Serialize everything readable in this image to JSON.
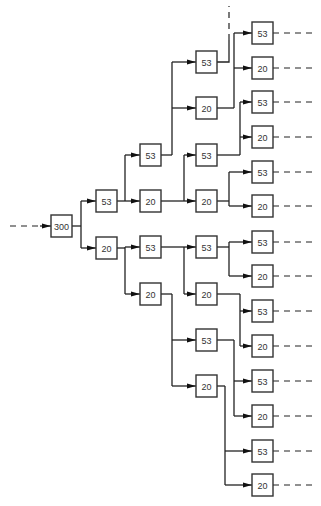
{
  "diagram": {
    "type": "tree",
    "root": {
      "label": "300",
      "x": 51,
      "y": 215
    },
    "box_size": [
      21,
      22
    ],
    "nodes": [
      {
        "id": "n0",
        "label": "300",
        "x": 51,
        "y": 215
      },
      {
        "id": "c1a",
        "label": "53",
        "x": 96,
        "y": 190
      },
      {
        "id": "c1b",
        "label": "20",
        "x": 96,
        "y": 237
      },
      {
        "id": "c2a",
        "label": "53",
        "x": 140,
        "y": 144
      },
      {
        "id": "c2b",
        "label": "20",
        "x": 140,
        "y": 190
      },
      {
        "id": "c2c",
        "label": "53",
        "x": 140,
        "y": 236
      },
      {
        "id": "c2d",
        "label": "20",
        "x": 140,
        "y": 283
      },
      {
        "id": "c3a",
        "label": "53",
        "x": 196,
        "y": 51
      },
      {
        "id": "c3b",
        "label": "20",
        "x": 196,
        "y": 97
      },
      {
        "id": "c3c",
        "label": "53",
        "x": 196,
        "y": 144
      },
      {
        "id": "c3d",
        "label": "20",
        "x": 196,
        "y": 190
      },
      {
        "id": "c3e",
        "label": "53",
        "x": 196,
        "y": 236
      },
      {
        "id": "c3f",
        "label": "20",
        "x": 196,
        "y": 283
      },
      {
        "id": "c3g",
        "label": "53",
        "x": 196,
        "y": 329
      },
      {
        "id": "c3h",
        "label": "20",
        "x": 196,
        "y": 375
      },
      {
        "id": "c4a",
        "label": "53",
        "x": 252,
        "y": 22
      },
      {
        "id": "c4b",
        "label": "20",
        "x": 252,
        "y": 57
      },
      {
        "id": "c4c",
        "label": "53",
        "x": 252,
        "y": 91
      },
      {
        "id": "c4d",
        "label": "20",
        "x": 252,
        "y": 126
      },
      {
        "id": "c4e",
        "label": "53",
        "x": 252,
        "y": 161
      },
      {
        "id": "c4f",
        "label": "20",
        "x": 252,
        "y": 195
      },
      {
        "id": "c4g",
        "label": "53",
        "x": 252,
        "y": 231
      },
      {
        "id": "c4h",
        "label": "20",
        "x": 252,
        "y": 265
      },
      {
        "id": "c4i",
        "label": "53",
        "x": 252,
        "y": 300
      },
      {
        "id": "c4j",
        "label": "20",
        "x": 252,
        "y": 335
      },
      {
        "id": "c4k",
        "label": "53",
        "x": 252,
        "y": 370
      },
      {
        "id": "c4l",
        "label": "20",
        "x": 252,
        "y": 405
      },
      {
        "id": "c4m",
        "label": "53",
        "x": 252,
        "y": 440
      },
      {
        "id": "c4n",
        "label": "20",
        "x": 252,
        "y": 474
      }
    ],
    "colors": {
      "line": "#222222",
      "box_border": "#333333",
      "text": "#333333",
      "background": "#ffffff"
    }
  }
}
